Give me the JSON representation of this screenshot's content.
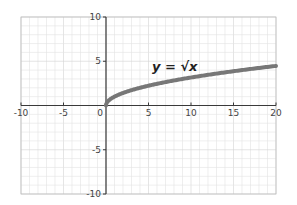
{
  "chart_data": {
    "type": "line",
    "title": "",
    "xlabel": "",
    "ylabel": "",
    "xlim": [
      -10,
      20
    ],
    "ylim": [
      -10,
      10
    ],
    "grid": true,
    "grid_minor_step": 1,
    "x_ticks": [
      -10,
      -5,
      0,
      5,
      10,
      15,
      20
    ],
    "y_ticks": [
      -10,
      -5,
      5,
      10
    ],
    "x_tick_labels": [
      "-10",
      "-5",
      "0",
      "5",
      "10",
      "15",
      "20"
    ],
    "y_tick_labels": [
      "-10",
      "-5",
      "5",
      "10"
    ],
    "series": [
      {
        "name": "y = √x",
        "function": "sqrt(x)",
        "x": [
          0,
          0.25,
          1,
          2,
          4,
          6,
          9,
          12,
          16,
          20
        ],
        "y": [
          0,
          0.5,
          1,
          1.41,
          2,
          2.45,
          3,
          3.46,
          4,
          4.47
        ],
        "color": "#777777"
      }
    ],
    "annotations": [
      {
        "text": "y = √x",
        "x": 7,
        "y": 4.2
      }
    ],
    "legend": null
  },
  "colors": {
    "curve": "#777777",
    "axis": "#3a3a3a",
    "grid": "#e2e2e2",
    "frame": "#bdbdbd"
  },
  "labels": {
    "function": "y = √x",
    "origin": "0"
  }
}
